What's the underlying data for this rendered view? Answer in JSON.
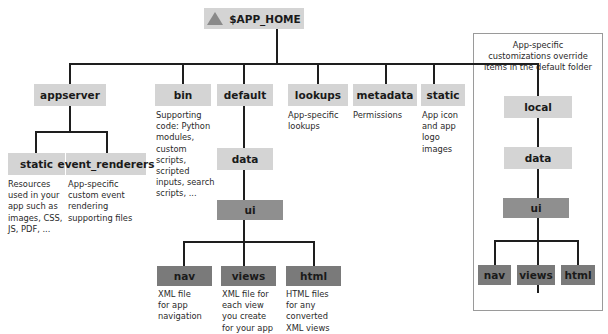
{
  "root": {
    "label": "$APP_HOME",
    "icon": "triangle-icon"
  },
  "level1": {
    "appserver": {
      "label": "appserver"
    },
    "bin": {
      "label": "bin",
      "desc": [
        "Supporting",
        "code: Python",
        "modules,",
        "custom",
        "scripts,",
        "scripted",
        "inputs, search",
        "scripts, ..."
      ]
    },
    "default": {
      "label": "default"
    },
    "lookups": {
      "label": "lookups",
      "desc": [
        "App-specific",
        "lookups"
      ]
    },
    "metadata": {
      "label": "metadata",
      "desc": [
        "Permissions"
      ]
    },
    "static": {
      "label": "static",
      "desc": [
        "App icon",
        "and app",
        "logo",
        "images"
      ]
    },
    "local": {
      "label": "local"
    }
  },
  "appserver_children": {
    "static": {
      "label": "static",
      "desc": [
        "Resources",
        "used in your",
        "app such as",
        "images, CSS,",
        "JS, PDF, ..."
      ]
    },
    "event_renderers": {
      "label": "event_renderers",
      "desc": [
        "App-specific",
        "custom event",
        "rendering",
        "supporting files"
      ]
    }
  },
  "default_children": {
    "data": {
      "label": "data"
    },
    "ui": {
      "label": "ui"
    },
    "nav": {
      "label": "nav",
      "desc": [
        "XML file",
        "for app",
        "navigation"
      ]
    },
    "views": {
      "label": "views",
      "desc": [
        "XML file for",
        "each view",
        "you create",
        "for your app"
      ]
    },
    "html": {
      "label": "html",
      "desc": [
        "HTML files",
        "for any",
        "converted",
        "XML views"
      ]
    }
  },
  "local_panel": {
    "note": [
      "App-specific",
      "customizations override",
      "items in the default folder"
    ],
    "data": {
      "label": "data"
    },
    "ui": {
      "label": "ui"
    },
    "nav": {
      "label": "nav"
    },
    "views": {
      "label": "views"
    },
    "html": {
      "label": "html"
    }
  }
}
